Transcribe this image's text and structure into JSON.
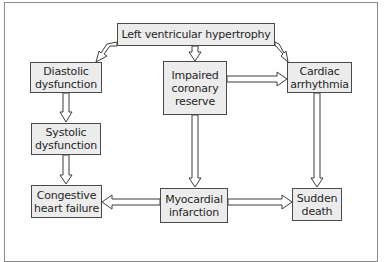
{
  "diagram": {
    "colors": {
      "box_fill": "#ececec",
      "box_border": "#4a4a4a",
      "text": "#262626",
      "arrow_stroke": "#3c3c3c",
      "frame_border": "#8a8a8a"
    },
    "nodes": {
      "lvh": {
        "lines": [
          "Left ventricular hypertrophy"
        ]
      },
      "diastolic": {
        "lines": [
          "Diastolic",
          "dysfunction"
        ]
      },
      "impaired": {
        "lines": [
          "Impaired",
          "coronary",
          "reserve"
        ]
      },
      "arrhythmia": {
        "lines": [
          "Cardiac",
          "arrhythmia"
        ]
      },
      "systolic": {
        "lines": [
          "Systolic",
          "dysfunction"
        ]
      },
      "chf": {
        "lines": [
          "Congestive",
          "heart failure"
        ]
      },
      "mi": {
        "lines": [
          "Myocardial",
          "infarction"
        ]
      },
      "sudden": {
        "lines": [
          "Sudden",
          "death"
        ]
      }
    },
    "edges": [
      {
        "from": "Left ventricular hypertrophy",
        "to": "Diastolic dysfunction"
      },
      {
        "from": "Left ventricular hypertrophy",
        "to": "Impaired coronary reserve"
      },
      {
        "from": "Left ventricular hypertrophy",
        "to": "Cardiac arrhythmia"
      },
      {
        "from": "Impaired coronary reserve",
        "to": "Cardiac arrhythmia"
      },
      {
        "from": "Diastolic dysfunction",
        "to": "Systolic dysfunction"
      },
      {
        "from": "Systolic dysfunction",
        "to": "Congestive heart failure"
      },
      {
        "from": "Impaired coronary reserve",
        "to": "Myocardial infarction"
      },
      {
        "from": "Myocardial infarction",
        "to": "Congestive heart failure"
      },
      {
        "from": "Myocardial infarction",
        "to": "Sudden death"
      },
      {
        "from": "Cardiac arrhythmia",
        "to": "Sudden death"
      }
    ]
  }
}
